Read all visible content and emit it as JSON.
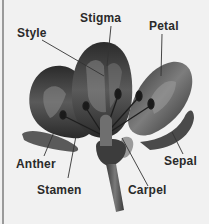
{
  "diagram": {
    "labels": {
      "stigma": "Stigma",
      "style": "Style",
      "petal": "Petal",
      "anther": "Anther",
      "stamen": "Stamen",
      "carpel": "Carpel",
      "sepal": "Sepal"
    }
  },
  "colors": {
    "background": "#f1f1f1",
    "label_text": "#2a2a2a",
    "petal_dark": "#2e2e2e",
    "petal_light": "#8a8a8a",
    "leader_line": "#333333"
  }
}
